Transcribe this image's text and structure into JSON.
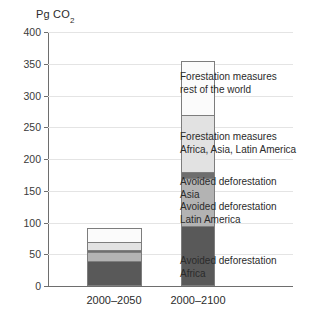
{
  "chart_data": {
    "type": "bar",
    "subtype": "stacked-vertical",
    "title": "",
    "ylabel": "Pg CO2",
    "ylabel_display": "Pg CO",
    "ylabel_subscript": "2",
    "xlabel": "",
    "categories": [
      "2000–2050",
      "2000–2100"
    ],
    "ylim": [
      0,
      400
    ],
    "ytick_values": [
      0,
      50,
      100,
      150,
      200,
      250,
      300,
      350,
      400
    ],
    "ytick_labels": [
      "0",
      "50",
      "100",
      "150",
      "200",
      "250",
      "300",
      "350",
      "400"
    ],
    "grid": "horizontal",
    "legend_position": "inline-annotations-right",
    "series": [
      {
        "name": "Avoided deforestation Africa",
        "label_lines": [
          "Avoided deforestation",
          "Africa"
        ],
        "color": "#595959",
        "values": [
          40,
          95
        ]
      },
      {
        "name": "Avoided deforestation Latin America",
        "label_lines": [
          "Avoided deforestation",
          "Latin America"
        ],
        "color": "#b3b3b3",
        "values": [
          13,
          75
        ]
      },
      {
        "name": "Avoided deforestation Asia",
        "label_lines": [
          "Avoided deforestation",
          "Asia"
        ],
        "color": "#6e6e6e",
        "values": [
          4,
          10
        ]
      },
      {
        "name": "Forestation measures Africa, Asia, Latin America",
        "label_lines": [
          "Forestation measures",
          "Africa, Asia, Latin America"
        ],
        "color": "#e2e2e2",
        "values": [
          13,
          90
        ]
      },
      {
        "name": "Forestation measures rest of the world",
        "label_lines": [
          "Forestation measures",
          "rest of the world"
        ],
        "color": "#fbfbfb",
        "values": [
          22,
          85
        ]
      }
    ],
    "totals": [
      92,
      355
    ],
    "annotations": [
      {
        "id": "forestation-row",
        "lines": [
          "Forestation measures",
          "rest of the world"
        ]
      },
      {
        "id": "forestation-aala",
        "lines": [
          "Forestation measures",
          "Africa, Asia, Latin America"
        ]
      },
      {
        "id": "avoided-asia",
        "lines": [
          "Avoided deforestation",
          "Asia"
        ]
      },
      {
        "id": "avoided-latam",
        "lines": [
          "Avoided deforestation",
          "Latin America"
        ]
      },
      {
        "id": "avoided-africa",
        "lines": [
          "Avoided deforestation",
          "Africa"
        ]
      }
    ]
  },
  "axis": {
    "title_text": "Pg CO",
    "title_subscript": "2",
    "ticks": [
      {
        "value": 400,
        "label": "400"
      },
      {
        "value": 350,
        "label": "350"
      },
      {
        "value": 300,
        "label": "300"
      },
      {
        "value": 250,
        "label": "250"
      },
      {
        "value": 200,
        "label": "200"
      },
      {
        "value": 150,
        "label": "150"
      },
      {
        "value": 100,
        "label": "100"
      },
      {
        "value": 50,
        "label": "50"
      },
      {
        "value": 0,
        "label": "0"
      }
    ]
  },
  "xaxis": {
    "labels": [
      {
        "text": "2000–2050"
      },
      {
        "text": "2000–2100"
      }
    ]
  },
  "annotations": {
    "a1_line1": "Forestation measures",
    "a1_line2": "rest of the world",
    "a2_line1": "Forestation measures",
    "a2_line2": "Africa, Asia, Latin America",
    "a3_line1": "Avoided deforestation",
    "a3_line2": "Asia",
    "a4_line1": "Avoided deforestation",
    "a4_line2": "Latin America",
    "a5_line1": "Avoided deforestation",
    "a5_line2": "Africa"
  },
  "colors": {
    "seg_africa": "#595959",
    "seg_latam": "#b3b3b3",
    "seg_asia": "#6e6e6e",
    "seg_forest_aala": "#e2e2e2",
    "seg_forest_row": "#fbfbfb",
    "grid": "#e4e4e4",
    "axis": "#6e6e6e",
    "text": "#2b2b2b"
  }
}
